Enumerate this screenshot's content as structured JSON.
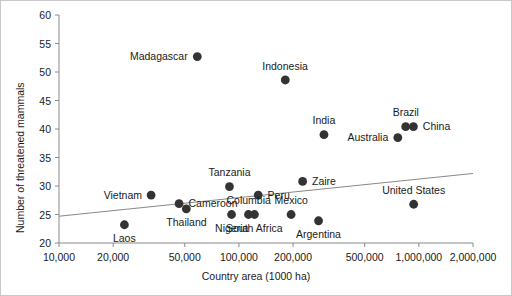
{
  "chart_data": {
    "type": "scatter",
    "title": "",
    "xlabel": "Country area (1000 ha)",
    "ylabel": "Number of threatened mammals",
    "xscale": "log",
    "yscale": "linear",
    "xlim": [
      10000,
      2000000
    ],
    "ylim": [
      20,
      60
    ],
    "grid": false,
    "legend": null,
    "xticks": [
      {
        "value": 10000,
        "label": "10,000"
      },
      {
        "value": 20000,
        "label": "20,000"
      },
      {
        "value": 50000,
        "label": "50,000"
      },
      {
        "value": 100000,
        "label": "100,000"
      },
      {
        "value": 200000,
        "label": "200,000"
      },
      {
        "value": 500000,
        "label": "500,000"
      },
      {
        "value": 1000000,
        "label": "1,000,000"
      },
      {
        "value": 2000000,
        "label": "2,000,000"
      }
    ],
    "yticks": [
      {
        "value": 20,
        "label": "20"
      },
      {
        "value": 25,
        "label": "25"
      },
      {
        "value": 30,
        "label": "30"
      },
      {
        "value": 35,
        "label": "35"
      },
      {
        "value": 40,
        "label": "40"
      },
      {
        "value": 45,
        "label": "45"
      },
      {
        "value": 50,
        "label": "50"
      },
      {
        "value": 55,
        "label": "55"
      },
      {
        "value": 60,
        "label": "60"
      }
    ],
    "marker": {
      "shape": "circle",
      "color": "#333333",
      "size": 4.4
    },
    "trendline": {
      "color": "#888888",
      "width": 1,
      "x_start": 10000,
      "y_start": 24.7,
      "x_end": 2000000,
      "y_end": 32.2
    },
    "points": [
      {
        "name": "Madagascar",
        "x": 58700,
        "y": 52.7,
        "label_pos": "left"
      },
      {
        "name": "Indonesia",
        "x": 181000,
        "y": 48.6,
        "label_pos": "top"
      },
      {
        "name": "India",
        "x": 297000,
        "y": 39.0,
        "label_pos": "top"
      },
      {
        "name": "Brazil",
        "x": 845000,
        "y": 40.4,
        "label_pos": "top"
      },
      {
        "name": "China",
        "x": 933000,
        "y": 40.4,
        "label_pos": "right"
      },
      {
        "name": "Australia",
        "x": 764000,
        "y": 38.5,
        "label_pos": "left"
      },
      {
        "name": "Zaire",
        "x": 226000,
        "y": 30.8,
        "label_pos": "right"
      },
      {
        "name": "Tanzania",
        "x": 88600,
        "y": 29.9,
        "label_pos": "top"
      },
      {
        "name": "Peru",
        "x": 128000,
        "y": 28.4,
        "label_pos": "right"
      },
      {
        "name": "Vietnam",
        "x": 32500,
        "y": 28.4,
        "label_pos": "left"
      },
      {
        "name": "Cameroon",
        "x": 46500,
        "y": 26.9,
        "label_pos": "right"
      },
      {
        "name": "Thailand",
        "x": 51000,
        "y": 26.0,
        "label_pos": "bottom"
      },
      {
        "name": "Nigeria",
        "x": 91000,
        "y": 25.0,
        "label_pos": "bottom"
      },
      {
        "name": "Columbia",
        "x": 113000,
        "y": 25.0,
        "label_pos": "top"
      },
      {
        "name": "South Africa",
        "x": 122000,
        "y": 25.0,
        "label_pos": "bottom"
      },
      {
        "name": "Mexico",
        "x": 195000,
        "y": 25.0,
        "label_pos": "top"
      },
      {
        "name": "United States",
        "x": 936000,
        "y": 26.8,
        "label_pos": "top"
      },
      {
        "name": "Argentina",
        "x": 277000,
        "y": 23.9,
        "label_pos": "bottom"
      },
      {
        "name": "Laos",
        "x": 23100,
        "y": 23.2,
        "label_pos": "bottom"
      }
    ]
  }
}
